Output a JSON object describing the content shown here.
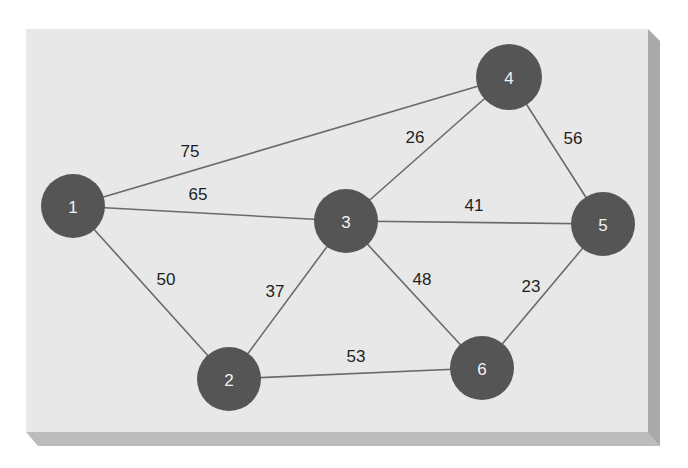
{
  "colors": {
    "background": "#ffffff",
    "panel_face": "#e9e9e9",
    "panel_side": "#a9a9a9",
    "panel_bottom": "#bcbcbc",
    "node_fill": "#555555",
    "node_text": "#f2f2f2",
    "edge_stroke": "#6a6a6a",
    "weight_text": "#1e1e1e"
  },
  "graph": {
    "nodes": [
      {
        "id": "1",
        "label": "1",
        "x": 73,
        "y": 206,
        "r": 32
      },
      {
        "id": "2",
        "label": "2",
        "x": 229,
        "y": 379,
        "r": 32
      },
      {
        "id": "3",
        "label": "3",
        "x": 346,
        "y": 221,
        "r": 32
      },
      {
        "id": "4",
        "label": "4",
        "x": 509,
        "y": 77,
        "r": 33
      },
      {
        "id": "5",
        "label": "5",
        "x": 603,
        "y": 224,
        "r": 32
      },
      {
        "id": "6",
        "label": "6",
        "x": 482,
        "y": 368,
        "r": 32
      }
    ],
    "edges": [
      {
        "from": "1",
        "to": "4",
        "weight": "75",
        "lx": 190,
        "ly": 151
      },
      {
        "from": "1",
        "to": "3",
        "weight": "65",
        "lx": 198,
        "ly": 194
      },
      {
        "from": "1",
        "to": "2",
        "weight": "50",
        "lx": 166,
        "ly": 279
      },
      {
        "from": "3",
        "to": "4",
        "weight": "26",
        "lx": 415,
        "ly": 137
      },
      {
        "from": "4",
        "to": "5",
        "weight": "56",
        "lx": 573,
        "ly": 138
      },
      {
        "from": "3",
        "to": "5",
        "weight": "41",
        "lx": 474,
        "ly": 205
      },
      {
        "from": "2",
        "to": "3",
        "weight": "37",
        "lx": 275,
        "ly": 291
      },
      {
        "from": "3",
        "to": "6",
        "weight": "48",
        "lx": 422,
        "ly": 279
      },
      {
        "from": "5",
        "to": "6",
        "weight": "23",
        "lx": 531,
        "ly": 286
      },
      {
        "from": "2",
        "to": "6",
        "weight": "53",
        "lx": 356,
        "ly": 356
      }
    ]
  }
}
